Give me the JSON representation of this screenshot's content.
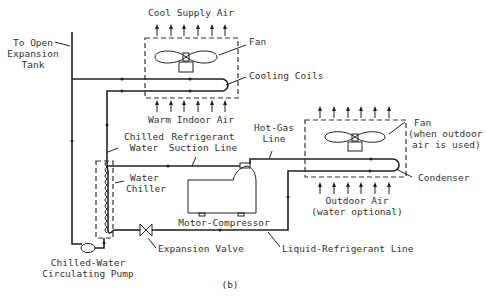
{
  "diagram": {
    "caption": "(b)",
    "labels": {
      "cool_supply_air": "Cool Supply Air",
      "fan_indoor": "Fan",
      "cooling_coils": "Cooling Coils",
      "warm_indoor_air": "Warm Indoor Air",
      "expansion_tank_1": "To Open",
      "expansion_tank_2": "Expansion",
      "expansion_tank_3": "Tank",
      "chilled_water_1": "Chilled",
      "chilled_water_2": "Water",
      "suction_1": "Refrigerant",
      "suction_2": "Suction Line",
      "hot_gas_1": "Hot-Gas",
      "hot_gas_2": "Line",
      "fan_outdoor_1": "Fan",
      "fan_outdoor_2": "(when outdoor",
      "fan_outdoor_3": "air is used)",
      "water_chiller_1": "Water",
      "water_chiller_2": "Chiller",
      "condenser": "Condenser",
      "outdoor_air_1": "Outdoor Air",
      "outdoor_air_2": "(water optional)",
      "motor_compressor": "Motor-Compressor",
      "expansion_valve": "Expansion Valve",
      "liquid_line": "Liquid-Refrigerant Line",
      "pump_1": "Chilled-Water",
      "pump_2": "Circulating Pump"
    }
  }
}
